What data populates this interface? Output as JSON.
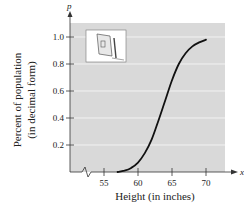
{
  "chart_data": {
    "type": "line",
    "title": "",
    "xlabel": "Height (in inches)",
    "ylabel_line1": "Percent of population",
    "ylabel_line2": "(in decimal form)",
    "x_axis_var": "x",
    "y_axis_var": "p",
    "x_ticks": [
      55,
      60,
      65,
      70
    ],
    "y_ticks": [
      0.2,
      0.4,
      0.6,
      0.8,
      1.0
    ],
    "x_tick_labels": [
      "55",
      "60",
      "65",
      "70"
    ],
    "y_tick_labels": [
      "0.2",
      "0.4",
      "0.6",
      "0.8",
      "1.0"
    ],
    "xlim": [
      50,
      72.5
    ],
    "ylim": [
      0,
      1.1
    ],
    "grid": true,
    "x_axis_break": true,
    "series": [
      {
        "name": "Cumulative percent of population by height",
        "x": [
          57,
          58,
          59,
          60,
          61,
          62,
          63,
          64,
          65,
          66,
          67,
          68,
          69,
          70
        ],
        "values": [
          0.0,
          0.01,
          0.03,
          0.07,
          0.14,
          0.24,
          0.38,
          0.53,
          0.68,
          0.8,
          0.88,
          0.93,
          0.96,
          0.98
        ]
      }
    ],
    "inset_image": "height measuring device illustration"
  },
  "colors": {
    "plot_background": "#d9d9d9",
    "gridline": "#f2f2f2",
    "curve": "#111111",
    "axis": "#333333"
  }
}
